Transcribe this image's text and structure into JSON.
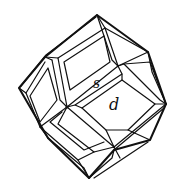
{
  "figure": {
    "type": "crystal-morphology-line-drawing",
    "stroke_color": "#111111",
    "background": "#ffffff"
  },
  "labels": {
    "face_s": "s",
    "face_d": "d"
  }
}
